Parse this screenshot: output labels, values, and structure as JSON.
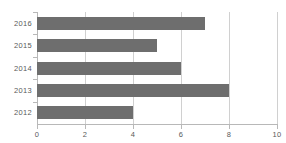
{
  "chart_data": {
    "type": "bar",
    "orientation": "horizontal",
    "title": "",
    "xlabel": "",
    "ylabel": "",
    "categories": [
      "2016",
      "2015",
      "2014",
      "2013",
      "2012"
    ],
    "values": [
      7,
      5,
      6,
      8,
      4
    ],
    "series": [
      {
        "name": "",
        "values": [
          7,
          5,
          6,
          8,
          4
        ]
      }
    ],
    "xlim": [
      0,
      10
    ],
    "xticks": [
      0,
      2,
      4,
      6,
      8,
      10
    ],
    "xtick_labels": [
      "0",
      "2",
      "4",
      "6",
      "8",
      "10"
    ],
    "ytick_labels": [
      "2016",
      "2015",
      "2014",
      "2013",
      "2012"
    ],
    "grid": "vertical",
    "legend": null,
    "colors": {
      "bar": "#6e6e6e",
      "gridline": "#d0d0d0",
      "axis": "#b8b8b8",
      "text": "#5a5a5a",
      "background": "#ffffff"
    }
  }
}
